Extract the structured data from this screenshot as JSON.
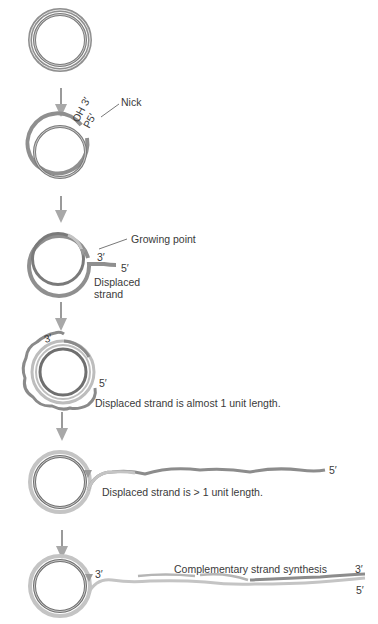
{
  "figure": {
    "colors": {
      "parental_strand": "#8f8f8f",
      "parental_inner": "#6b6b6b",
      "new_strand": "#bfbfbf",
      "arrow": "#9a9a9a",
      "text": "#3a3a3a"
    },
    "steps": [
      {
        "id": 1,
        "labels": []
      },
      {
        "id": 2,
        "labels": {
          "oh3": "OH 3′",
          "p5": "P5′",
          "nick": "Nick"
        }
      },
      {
        "id": 3,
        "labels": {
          "growing_point": "Growing point",
          "three_prime": "3′",
          "five_prime": "5′",
          "displaced_1": "Displaced",
          "displaced_2": "strand"
        }
      },
      {
        "id": 4,
        "labels": {
          "three_prime": "3′",
          "five_prime": "5′",
          "caption": "Displaced strand is almost 1 unit length."
        }
      },
      {
        "id": 5,
        "labels": {
          "five_prime": "5′",
          "caption": "Displaced strand is > 1 unit length."
        }
      },
      {
        "id": 6,
        "labels": {
          "three_prime_left": "3′",
          "caption": "Complementary strand synthesis",
          "three_prime_right": "3′",
          "five_prime_right": "5′"
        }
      }
    ]
  }
}
